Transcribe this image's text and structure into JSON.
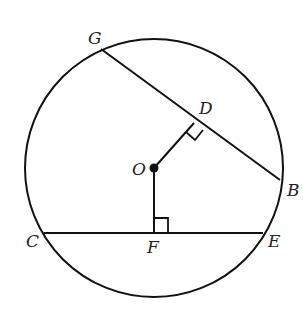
{
  "diagram": {
    "type": "circle-geometry",
    "stroke_color": "#111111",
    "background": "#ffffff",
    "circle": {
      "center_label": "O",
      "cx": 154,
      "cy": 168,
      "r": 129
    },
    "points": {
      "G": {
        "label": "G",
        "x": 101,
        "y": 49
      },
      "B": {
        "label": "B",
        "x": 280,
        "y": 180
      },
      "D": {
        "label": "D",
        "x": 194,
        "y": 123
      },
      "O": {
        "label": "O",
        "x": 154,
        "y": 168
      },
      "C": {
        "label": "C",
        "x": 44,
        "y": 233
      },
      "E": {
        "label": "E",
        "x": 263,
        "y": 233
      },
      "F": {
        "label": "F",
        "x": 154,
        "y": 233
      }
    },
    "segments": [
      {
        "name": "chord-GB",
        "from": "G",
        "to": "B"
      },
      {
        "name": "chord-CE",
        "from": "C",
        "to": "E"
      },
      {
        "name": "segment-OD",
        "from": "O",
        "to": "D"
      },
      {
        "name": "segment-OF",
        "from": "O",
        "to": "F"
      }
    ],
    "right_angles": [
      "D",
      "F"
    ]
  }
}
